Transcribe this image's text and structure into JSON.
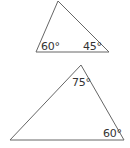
{
  "triangles": [
    {
      "name": "top-triangle",
      "angles": {
        "left": "60°",
        "right": "45°"
      }
    },
    {
      "name": "bottom-triangle",
      "angles": {
        "top": "75°",
        "right": "60°"
      }
    }
  ],
  "colors": {
    "stroke": "#555555",
    "text": "#333333"
  }
}
